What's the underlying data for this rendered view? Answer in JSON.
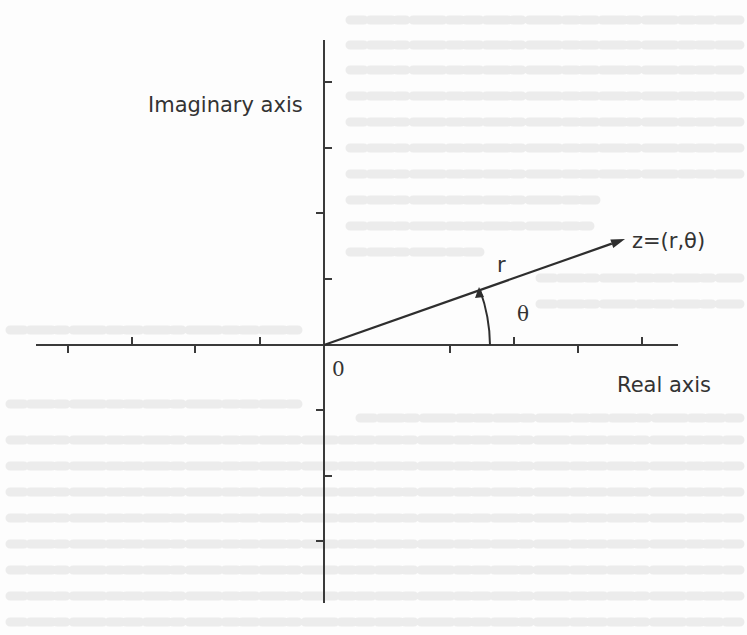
{
  "figure": {
    "type": "complex-plane-polar-diagram",
    "origin": {
      "x": 324,
      "y": 345
    },
    "colors": {
      "ink": "#333333",
      "background": "#fdfdfd",
      "bleed_through": "#ececec"
    }
  },
  "axes": {
    "imaginary": {
      "label": "Imaginary axis",
      "label_pos": {
        "x": 148,
        "y": 112
      },
      "x": 324,
      "y_start": 40,
      "y_end": 603,
      "ticks": [
        {
          "y": 82,
          "side": "right"
        },
        {
          "y": 148,
          "side": "right"
        },
        {
          "y": 213,
          "side": "left"
        },
        {
          "y": 279,
          "side": "right"
        },
        {
          "y": 410,
          "side": "left"
        },
        {
          "y": 476,
          "side": "right"
        },
        {
          "y": 541,
          "side": "left"
        }
      ]
    },
    "real": {
      "label": "Real axis",
      "label_pos": {
        "x": 617,
        "y": 392
      },
      "y": 345,
      "x_start": 36,
      "x_end": 678,
      "ticks": [
        {
          "x": 68,
          "side": "below"
        },
        {
          "x": 132,
          "side": "above"
        },
        {
          "x": 195,
          "side": "below"
        },
        {
          "x": 260,
          "side": "above"
        },
        {
          "x": 450,
          "side": "below"
        },
        {
          "x": 514,
          "side": "above"
        },
        {
          "x": 578,
          "side": "below"
        },
        {
          "x": 642,
          "side": "above"
        }
      ]
    }
  },
  "origin_label": {
    "text": "0",
    "pos": {
      "x": 332,
      "y": 376
    }
  },
  "vector": {
    "from": {
      "x": 324,
      "y": 345
    },
    "to": {
      "x": 625,
      "y": 239
    },
    "label": "z=(r,θ)",
    "label_pos": {
      "x": 632,
      "y": 248
    },
    "magnitude_label": "r",
    "magnitude_label_pos": {
      "x": 497,
      "y": 272
    }
  },
  "angle": {
    "label": "θ",
    "label_pos": {
      "x": 517,
      "y": 321
    },
    "arc_radius": 166,
    "arc_start": {
      "x": 490,
      "y": 345
    },
    "arc_end": {
      "x": 480,
      "y": 290
    }
  }
}
